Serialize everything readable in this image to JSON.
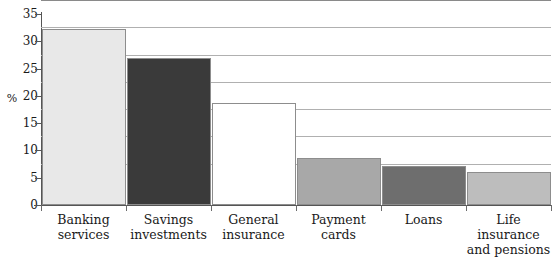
{
  "chart_data": {
    "type": "bar",
    "title": "",
    "xlabel": "",
    "ylabel": "%",
    "ylim": [
      0,
      35
    ],
    "yticks": [
      0,
      5,
      10,
      15,
      20,
      25,
      30,
      35
    ],
    "grid": true,
    "legend": "none",
    "categories": [
      "Banking services",
      "Savings investments",
      "General insurance",
      "Payment cards",
      "Loans",
      "Life insurance and pensions"
    ],
    "category_lines": [
      [
        "Banking",
        "services"
      ],
      [
        "Savings",
        "investments"
      ],
      [
        "General",
        "insurance"
      ],
      [
        "Payment",
        "cards"
      ],
      [
        "Loans",
        ""
      ],
      [
        "Life insurance",
        "and pensions"
      ]
    ],
    "values": [
      32.3,
      26.9,
      18.7,
      8.6,
      7.1,
      6.1
    ],
    "bar_colors": [
      "#e8e8e8",
      "#3a3a3a",
      "#ffffff",
      "#a8a8a8",
      "#6e6e6e",
      "#bdbdbd"
    ],
    "bar_border_color": "#8d8d8d",
    "gridline_color": "#b0b0b0",
    "axis_color": "#555555"
  }
}
